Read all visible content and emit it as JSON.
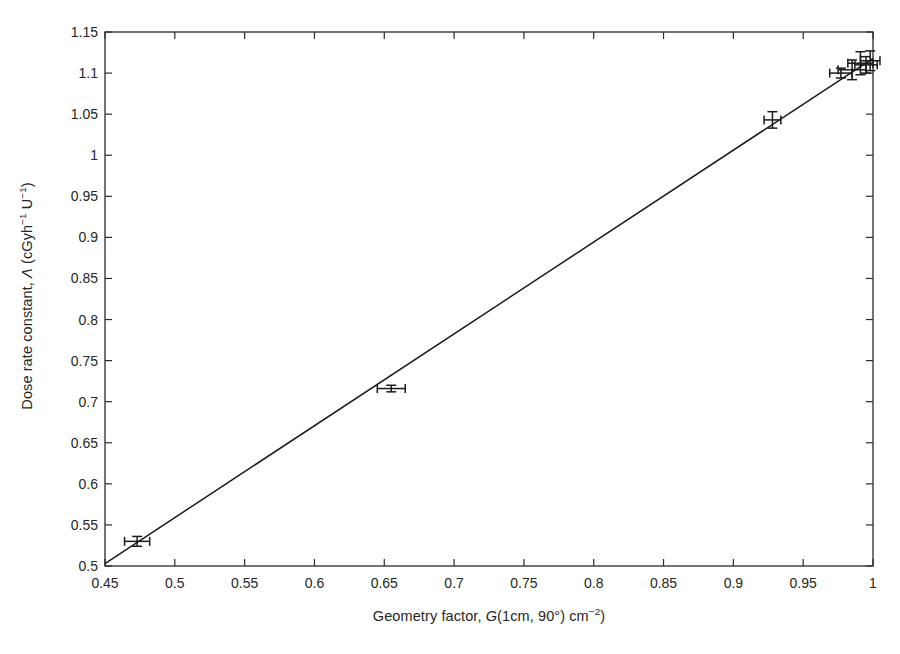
{
  "chart_data": {
    "type": "scatter",
    "title": "",
    "xlabel_plain": "Geometry factor, G(1cm, 90°) cm−2)",
    "ylabel_plain": "Dose rate constant, Λ (cGyh−1 U−1)",
    "xlabel_parts": {
      "pre": "Geometry factor, ",
      "var": "G",
      "mid": "(1cm, 90°) cm",
      "sup": "−2",
      "post": ")"
    },
    "ylabel_parts": {
      "pre": "Dose rate constant, ",
      "var": "Λ",
      "mid": " (cGyh",
      "sup1": "−1",
      "mid2": " U",
      "sup2": "−1",
      "post": ")"
    },
    "xlim": [
      0.45,
      1.0
    ],
    "ylim": [
      0.5,
      1.15
    ],
    "xticks": [
      0.45,
      0.5,
      0.55,
      0.6,
      0.65,
      0.7,
      0.75,
      0.8,
      0.85,
      0.9,
      0.95,
      1
    ],
    "xtick_labels": [
      "0.45",
      "0.5",
      "0.55",
      "0.6",
      "0.65",
      "0.7",
      "0.75",
      "0.8",
      "0.85",
      "0.9",
      "0.95",
      "1"
    ],
    "yticks": [
      0.5,
      0.55,
      0.6,
      0.65,
      0.7,
      0.75,
      0.8,
      0.85,
      0.9,
      0.95,
      1,
      1.05,
      1.1,
      1.15
    ],
    "ytick_labels": [
      "0.5",
      "0.55",
      "0.6",
      "0.65",
      "0.7",
      "0.75",
      "0.8",
      "0.85",
      "0.9",
      "0.95",
      "1",
      "1.05",
      "1.1",
      "1.15"
    ],
    "grid": false,
    "legend": null,
    "box": true,
    "series": [
      {
        "name": "Measured dose rate constants",
        "marker": "errorbar-cross",
        "color": "#1a1a1a",
        "points": [
          {
            "x": 0.473,
            "y": 0.53,
            "xerr": 0.009,
            "yerr": 0.006
          },
          {
            "x": 0.655,
            "y": 0.716,
            "xerr": 0.01,
            "yerr": 0.004
          },
          {
            "x": 0.928,
            "y": 1.043,
            "xerr": 0.006,
            "yerr": 0.01
          },
          {
            "x": 0.977,
            "y": 1.1,
            "xerr": 0.008,
            "yerr": 0.006
          },
          {
            "x": 0.985,
            "y": 1.104,
            "xerr": 0.01,
            "yerr": 0.012
          },
          {
            "x": 0.991,
            "y": 1.112,
            "xerr": 0.009,
            "yerr": 0.014
          },
          {
            "x": 0.995,
            "y": 1.11,
            "xerr": 0.008,
            "yerr": 0.01
          },
          {
            "x": 0.998,
            "y": 1.115,
            "xerr": 0.007,
            "yerr": 0.012
          }
        ]
      },
      {
        "name": "Linear fit",
        "type": "line",
        "color": "#1a1a1a",
        "x": [
          0.45,
          1.0
        ],
        "y": [
          0.503,
          1.118
        ]
      }
    ]
  }
}
